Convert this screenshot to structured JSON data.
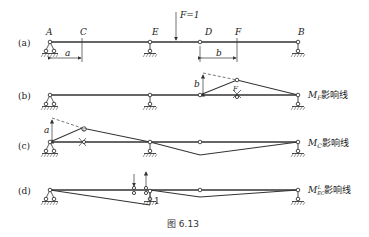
{
  "figure": {
    "caption": "图 6.13",
    "panels": [
      {
        "id": "a",
        "label": "(a)",
        "points": {
          "A": "A",
          "C": "C",
          "E": "E",
          "D": "D",
          "F": "F",
          "B": "B"
        },
        "load": "F=1",
        "dims": {
          "a": "a",
          "b": "b"
        }
      },
      {
        "id": "b",
        "label": "(b)",
        "dim": "b",
        "point": "F",
        "title_main": "M",
        "title_sub": "F",
        "title_suffix": "影响线"
      },
      {
        "id": "c",
        "label": "(c)",
        "dim": "a",
        "point": "C",
        "title_main": "M",
        "title_sub": "C",
        "title_suffix": "影响线"
      },
      {
        "id": "d",
        "label": "(d)",
        "unit": "1",
        "title_main": "M",
        "title_sub": "EC",
        "title_sup": "L",
        "title_suffix": "影响线"
      }
    ]
  }
}
